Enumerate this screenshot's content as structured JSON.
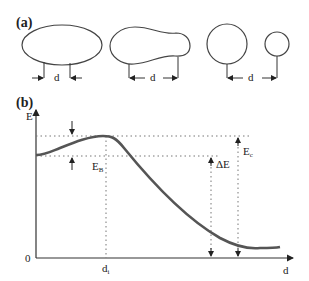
{
  "panel_a": {
    "label": "(a)",
    "distance_labels": [
      "d",
      "d",
      "d"
    ]
  },
  "panel_b": {
    "label": "(b)",
    "y_axis_label": "E",
    "x_axis_label": "d",
    "origin_label": "0",
    "tick_label_di": "d",
    "tick_label_di_sub": "i",
    "barrier_label": "E",
    "barrier_label_sub": "B",
    "delta_label": "ΔE",
    "ec_label": "E",
    "ec_label_sub": "c"
  },
  "colors": {
    "curve": "#555555",
    "lines": "#333333",
    "dotted": "#777777"
  }
}
